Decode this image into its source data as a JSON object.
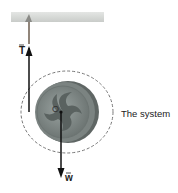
{
  "diagram": {
    "labels": {
      "tension": "T",
      "weight": "w",
      "center": "O",
      "system": "The system"
    },
    "colors": {
      "ceiling": "#d6d8d6",
      "string": "#4a3a2e",
      "disc_outer": "#6f7674",
      "disc_rim": "#9aa19f",
      "disc_inner": "#8c9593",
      "swirl": "#5a6260",
      "arrow": "#111111",
      "dashed": "#777777"
    }
  }
}
